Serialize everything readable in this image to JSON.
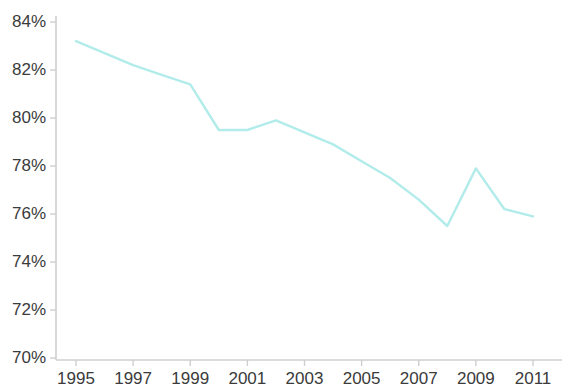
{
  "chart_data": {
    "type": "line",
    "title": "",
    "xlabel": "",
    "ylabel": "",
    "x": [
      1995,
      1996,
      1997,
      1998,
      1999,
      2000,
      2001,
      2002,
      2003,
      2004,
      2005,
      2006,
      2007,
      2008,
      2009,
      2010,
      2011
    ],
    "values": [
      83.2,
      82.7,
      82.2,
      81.8,
      81.4,
      79.5,
      79.5,
      79.9,
      79.4,
      78.9,
      78.2,
      77.5,
      76.6,
      75.5,
      77.9,
      76.2,
      75.9
    ],
    "series": [
      {
        "name": "series-1",
        "color": "#b2ecea",
        "values": [
          83.2,
          82.7,
          82.2,
          81.8,
          81.4,
          79.5,
          79.5,
          79.9,
          79.4,
          78.9,
          78.2,
          77.5,
          76.6,
          75.5,
          77.9,
          76.2,
          75.9
        ]
      }
    ],
    "xlim": [
      1995,
      2011
    ],
    "ylim": [
      70,
      84
    ],
    "x_tick_labels": [
      "1995",
      "1997",
      "1999",
      "2001",
      "2003",
      "2005",
      "2007",
      "2009",
      "2011"
    ],
    "x_tick_values": [
      1995,
      1997,
      1999,
      2001,
      2003,
      2005,
      2007,
      2009,
      2011
    ],
    "y_tick_labels": [
      "84%",
      "82%",
      "80%",
      "78%",
      "76%",
      "74%",
      "72%",
      "70%"
    ],
    "y_tick_values": [
      84,
      82,
      80,
      78,
      76,
      74,
      72,
      70
    ],
    "grid": false,
    "legend": null,
    "legend_position": "none",
    "axis_color": "#cfcfcf",
    "tick_text_color": "#3b3b3b",
    "line_color": "#b2ecea",
    "line_width": 2.4,
    "background_color": "#ffffff"
  }
}
